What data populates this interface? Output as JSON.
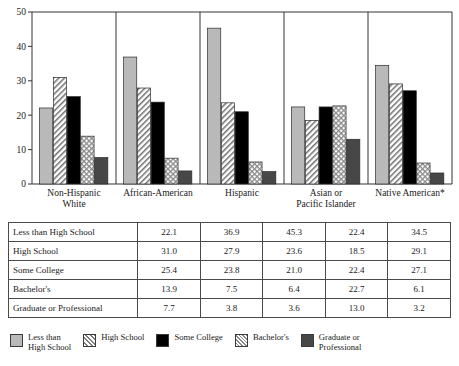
{
  "chart_data": {
    "type": "bar",
    "title": "",
    "subtitle": "",
    "xlabel": "",
    "ylabel": "",
    "ylim": [
      0,
      50
    ],
    "yticks": [
      0,
      10,
      20,
      30,
      40,
      50
    ],
    "grid": false,
    "legend_position": "bottom",
    "categories": [
      "Non-Hispanic\nWhite",
      "African-American",
      "Hispanic",
      "Asian or\nPacific Islander",
      "Native American*"
    ],
    "series": [
      {
        "name": "Less than High School",
        "values": [
          22.1,
          36.9,
          45.3,
          22.4,
          34.5
        ],
        "fill": "solid-light"
      },
      {
        "name": "High School",
        "values": [
          31.0,
          27.9,
          23.6,
          18.5,
          29.1
        ],
        "fill": "diagonal-hatch"
      },
      {
        "name": "Some College",
        "values": [
          25.4,
          23.8,
          21.0,
          22.4,
          27.1
        ],
        "fill": "solid-black"
      },
      {
        "name": "Bachelor's",
        "values": [
          13.9,
          7.5,
          6.4,
          22.7,
          6.1
        ],
        "fill": "crosshatch"
      },
      {
        "name": "Graduate or Professional",
        "values": [
          7.7,
          3.8,
          3.6,
          13.0,
          3.2
        ],
        "fill": "solid-dark"
      }
    ]
  },
  "axis": {
    "tick_labels": [
      "50",
      "40",
      "30",
      "20",
      "10",
      "0"
    ],
    "category_labels": [
      "Non-Hispanic\nWhite",
      "African-American",
      "Hispanic",
      "Asian or\nPacific Islander",
      "Native American*"
    ]
  },
  "table": {
    "row_labels": [
      "Less than High School",
      "High School",
      "Some College",
      "Bachelor's",
      "Graduate or Professional"
    ],
    "rows": [
      [
        "22.1",
        "36.9",
        "45.3",
        "22.4",
        "34.5"
      ],
      [
        "31.0",
        "27.9",
        "23.6",
        "18.5",
        "29.1"
      ],
      [
        "25.4",
        "23.8",
        "21.0",
        "22.4",
        "27.1"
      ],
      [
        "13.9",
        "7.5",
        "6.4",
        "22.7",
        "6.1"
      ],
      [
        "7.7",
        "3.8",
        "3.6",
        "13.0",
        "3.2"
      ]
    ]
  },
  "legend": {
    "items": [
      {
        "label": "Less than\nHigh School",
        "fill": "solid-light"
      },
      {
        "label": "High School",
        "fill": "diagonal-hatch"
      },
      {
        "label": "Some College",
        "fill": "solid-black"
      },
      {
        "label": "Bachelor's",
        "fill": "crosshatch"
      },
      {
        "label": "Graduate or\nProfessional",
        "fill": "solid-dark"
      }
    ]
  },
  "colors": {
    "light_gray": "#b9b9b9",
    "dark_gray": "#474747",
    "black": "#000000",
    "hatch_line": "#7d7d7d",
    "axis": "#333333",
    "table_border": "#4a4a4a"
  }
}
